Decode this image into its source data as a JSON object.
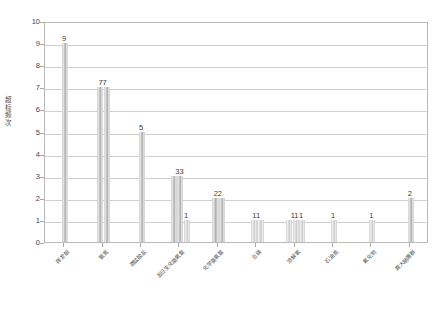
{
  "chart_data": {
    "type": "bar",
    "title": "",
    "xlabel": "",
    "ylabel": "超标频次",
    "ylim": [
      0,
      10
    ],
    "ytick_labels": [
      "0",
      "1",
      "2",
      "3",
      "4",
      "5",
      "6",
      "7",
      "8",
      "9",
      "10"
    ],
    "grid": true,
    "legend": "none",
    "categories": [
      "挥发酚",
      "氨氮",
      "高锰酸盐",
      "五日生化需氧量",
      "化学需氧量",
      "总磷",
      "溶解氧",
      "石油类",
      "氟化物",
      "粪大肠菌群"
    ],
    "bars": [
      {
        "category_index": 0,
        "values": [
          9
        ],
        "labels": [
          "9"
        ]
      },
      {
        "category_index": 1,
        "values": [
          7,
          7
        ],
        "labels": [
          "7",
          "7"
        ]
      },
      {
        "category_index": 2,
        "values": [
          5
        ],
        "labels": [
          "5"
        ]
      },
      {
        "category_index": 3,
        "values": [
          3,
          3,
          1
        ],
        "labels": [
          "3",
          "3",
          "1"
        ]
      },
      {
        "category_index": 4,
        "values": [
          2,
          2
        ],
        "labels": [
          "2",
          "2"
        ]
      },
      {
        "category_index": 5,
        "values": [
          1,
          1
        ],
        "labels": [
          "1",
          "1"
        ]
      },
      {
        "category_index": 6,
        "values": [
          1,
          1,
          1
        ],
        "labels": [
          "1",
          "1",
          "1"
        ]
      },
      {
        "category_index": 7,
        "values": [
          1
        ],
        "labels": [
          "1"
        ]
      },
      {
        "category_index": 8,
        "values": [
          1
        ],
        "labels": [
          "1"
        ]
      },
      {
        "category_index": 9,
        "values": [
          2
        ],
        "labels": [
          "2"
        ]
      }
    ],
    "data_label_groups": [
      "9",
      "77",
      "5",
      "33",
      "1",
      "22",
      "11",
      "11",
      "1",
      "1",
      "1",
      "2"
    ],
    "colors": {
      "bar_fill_dark": "#a8a8a8",
      "bar_fill_light": "#d2d2d2",
      "gridline": "#cfcfcf",
      "axis": "#b9b9b9",
      "text": "#3d3d3d",
      "background": "#ffffff"
    }
  }
}
